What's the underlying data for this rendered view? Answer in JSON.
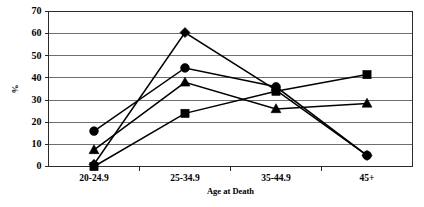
{
  "chart_data": {
    "type": "line",
    "title": "",
    "xlabel": "Age at Death",
    "ylabel": "%",
    "categories": [
      "20-24.9",
      "25-34.9",
      "35-44.9",
      "45+"
    ],
    "ylim": [
      0,
      70
    ],
    "ytick_step": 10,
    "ytick_labels": [
      "0",
      "10",
      "20",
      "30",
      "40",
      "50",
      "60",
      "70"
    ],
    "grid": "horizontal",
    "legend": "none",
    "marker_color": "#000000",
    "line_color": "#000000",
    "series": [
      {
        "name": "diamond-series",
        "marker": "diamond",
        "values": [
          1,
          60.5,
          34.5,
          5
        ]
      },
      {
        "name": "square-series",
        "marker": "square",
        "values": [
          0,
          24,
          34,
          41.5
        ]
      },
      {
        "name": "triangle-series",
        "marker": "triangle",
        "values": [
          7.5,
          38,
          26,
          28.5
        ]
      },
      {
        "name": "circle-series",
        "marker": "circle",
        "values": [
          16,
          44.5,
          36,
          5
        ]
      }
    ]
  }
}
